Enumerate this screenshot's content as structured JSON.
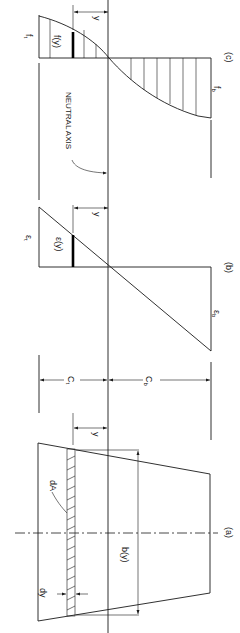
{
  "diagram": {
    "orientation": "rotated 90° clockwise (read with page turned)",
    "panels": [
      {
        "id": "a",
        "label": "(a)",
        "description": "Cross-section with differential strip dA of thickness dy and width b(y)"
      },
      {
        "id": "b",
        "label": "(b)",
        "description": "Linear strain distribution"
      },
      {
        "id": "c",
        "label": "(c)",
        "description": "Nonlinear stress distribution"
      }
    ],
    "labels": {
      "panel_a": "(a)",
      "panel_b": "(b)",
      "panel_c": "(c)",
      "neutral_axis": "NEUTRAL AXIS",
      "y": "y",
      "dA": "dA",
      "dy": "dy",
      "b_of_y": "b(y)",
      "c_t": "C",
      "c_t_sub": "t",
      "c_b": "C",
      "c_b_sub": "b",
      "eps_t": "ε",
      "eps_t_sub": "t",
      "eps_b": "ε",
      "eps_b_sub": "b",
      "eps_y": "ε(y)",
      "f_t": "f",
      "f_t_sub": "t",
      "f_b": "f",
      "f_b_sub": "b",
      "f_y": "f(y)"
    },
    "colors": {
      "line": "#1a1a1a",
      "background": "#ffffff"
    }
  }
}
